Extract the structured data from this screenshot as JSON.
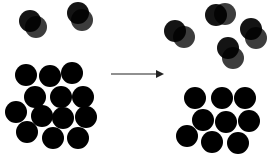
{
  "diagram": {
    "background": "#ffffff",
    "molecule_color": "#000000",
    "gas_color": "#1a1a1a",
    "arrow_color": "#6b6b6b",
    "radius": 11,
    "arrow": {
      "x1": 111,
      "y1": 74,
      "x2": 162,
      "y2": 74
    },
    "before": {
      "gas_molecules": [
        {
          "a": [
            30,
            21
          ],
          "b": [
            36,
            27
          ]
        },
        {
          "a": [
            78,
            13
          ],
          "b": [
            82,
            20
          ]
        }
      ],
      "liquid_cluster": [
        [
          26,
          75
        ],
        [
          50,
          76
        ],
        [
          72,
          73
        ],
        [
          35,
          97
        ],
        [
          61,
          97
        ],
        [
          83,
          97
        ],
        [
          16,
          112
        ],
        [
          42,
          116
        ],
        [
          63,
          118
        ],
        [
          86,
          117
        ],
        [
          27,
          132
        ],
        [
          53,
          138
        ],
        [
          78,
          138
        ]
      ]
    },
    "after": {
      "gas_molecules": [
        {
          "a": [
            175,
            31
          ],
          "b": [
            184,
            37
          ]
        },
        {
          "a": [
            216,
            15
          ],
          "b": [
            225,
            14
          ]
        },
        {
          "a": [
            228,
            48
          ],
          "b": [
            233,
            58
          ]
        },
        {
          "a": [
            251,
            29
          ],
          "b": [
            256,
            38
          ]
        }
      ],
      "liquid_cluster": [
        [
          195,
          98
        ],
        [
          222,
          98
        ],
        [
          245,
          98
        ],
        [
          203,
          120
        ],
        [
          226,
          122
        ],
        [
          249,
          121
        ],
        [
          187,
          136
        ],
        [
          212,
          142
        ],
        [
          238,
          143
        ]
      ]
    }
  }
}
